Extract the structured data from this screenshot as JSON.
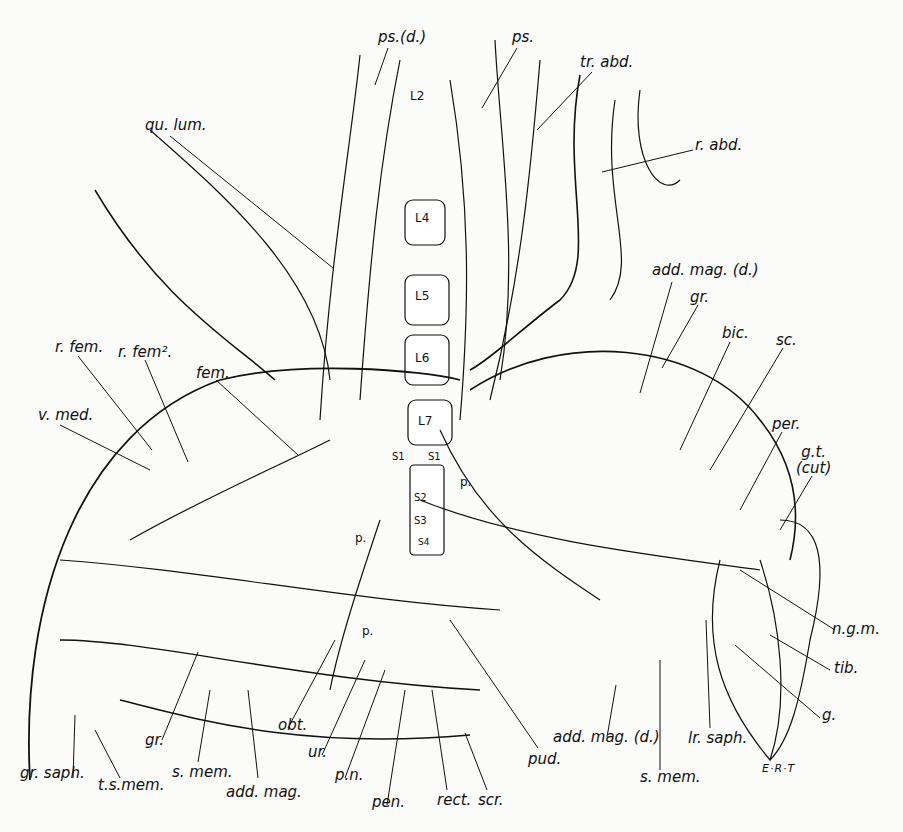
{
  "figure": {
    "type": "anatomical-illustration",
    "signature": "E·R·T",
    "vertebrae": [
      "L2",
      "L4",
      "L5",
      "L6",
      "L7",
      "S1",
      "S1",
      "S2",
      "S3",
      "S4"
    ],
    "labels": [
      {
        "id": "ps-d",
        "text": "ps.(d.)"
      },
      {
        "id": "ps",
        "text": "ps."
      },
      {
        "id": "tr-abd",
        "text": "tr. abd."
      },
      {
        "id": "r-abd",
        "text": "r. abd."
      },
      {
        "id": "qu-lum",
        "text": "qu. lum."
      },
      {
        "id": "add-mag-d-top",
        "text": "add. mag. (d.)"
      },
      {
        "id": "gr-top",
        "text": "gr."
      },
      {
        "id": "bic",
        "text": "bic."
      },
      {
        "id": "sc",
        "text": "sc."
      },
      {
        "id": "per",
        "text": "per."
      },
      {
        "id": "g-t-cut",
        "text": "g.t.\n(cut)"
      },
      {
        "id": "r-fem",
        "text": "r. fem."
      },
      {
        "id": "r-fem2",
        "text": "r. fem²."
      },
      {
        "id": "fem",
        "text": "fem."
      },
      {
        "id": "v-med",
        "text": "v. med."
      },
      {
        "id": "n-g-m",
        "text": "n.g.m."
      },
      {
        "id": "tib",
        "text": "tib."
      },
      {
        "id": "g",
        "text": "g."
      },
      {
        "id": "gr-saph",
        "text": "gr. saph."
      },
      {
        "id": "t-s-mem",
        "text": "t.s.mem."
      },
      {
        "id": "gr-bottom",
        "text": "gr."
      },
      {
        "id": "s-mem-left",
        "text": "s. mem."
      },
      {
        "id": "add-mag",
        "text": "add. mag."
      },
      {
        "id": "obt",
        "text": "obt."
      },
      {
        "id": "ur",
        "text": "ur."
      },
      {
        "id": "p-n",
        "text": "p.n."
      },
      {
        "id": "pen",
        "text": "pen."
      },
      {
        "id": "rect",
        "text": "rect."
      },
      {
        "id": "scr",
        "text": "scr."
      },
      {
        "id": "pud",
        "text": "pud."
      },
      {
        "id": "add-mag-d-bottom",
        "text": "add. mag. (d.)"
      },
      {
        "id": "s-mem-right",
        "text": "s. mem."
      },
      {
        "id": "lr-saph",
        "text": "lr. saph."
      },
      {
        "id": "p1",
        "text": "p."
      },
      {
        "id": "p2",
        "text": "p."
      },
      {
        "id": "p3",
        "text": "p."
      }
    ]
  }
}
